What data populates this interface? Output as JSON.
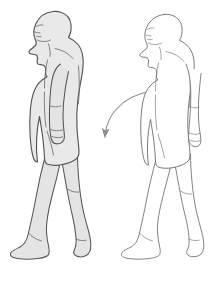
{
  "illustration": {
    "title": "Human Walking Posture Comparison",
    "background_color": "#ffffff",
    "width": 213,
    "height": 283,
    "figures": [
      {
        "id": "left-figure",
        "label": "Shaded walking figure (side profile, facing left)",
        "style": "filled-silhouette",
        "fill_color": "#e9e9e9",
        "stroke_color": "#555555",
        "facing": "left",
        "pose": "mid-stride walking, rear foot flat, front foot toe-down, arm hanging at side",
        "bounds": {
          "x": 10,
          "y": 10,
          "width": 82,
          "height": 255
        }
      },
      {
        "id": "right-figure",
        "label": "Outline walking figure (side profile, facing left)",
        "style": "line-outline",
        "fill_color": "#ffffff",
        "stroke_color": "#6b6b6b",
        "facing": "left",
        "pose": "mid-stride walking, rear foot flat, front foot toe-down, arm swung forward",
        "bounds": {
          "x": 120,
          "y": 14,
          "width": 88,
          "height": 251
        }
      }
    ],
    "arrow": {
      "id": "transition-arrow",
      "label": "Curved arrow indicating transition from right figure to left figure",
      "color": "#8d8d8d",
      "start": {
        "x": 150,
        "y": 92
      },
      "end": {
        "x": 105,
        "y": 137
      },
      "direction": "down-left",
      "shape": "curved-arc"
    }
  }
}
